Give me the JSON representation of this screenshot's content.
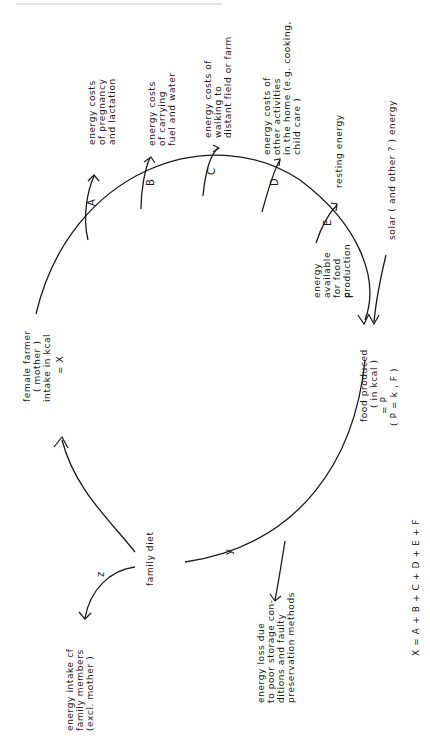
{
  "header_fragment": "",
  "nodes": {
    "mother": [
      "female farmer",
      "( mother )",
      "intake in kcal",
      "= X"
    ],
    "food_produced": [
      "food  produced",
      "( in  kcal )",
      "= P",
      "( P = k , F )"
    ],
    "family_diet": [
      "family diet"
    ]
  },
  "outflows": {
    "A": {
      "letter": "A",
      "lines": [
        "energy  costs",
        "of  pregnancy",
        "and  lactation"
      ]
    },
    "B": {
      "letter": "B",
      "lines": [
        "energy costs",
        "of  carrying",
        "fuel and  water"
      ]
    },
    "C": {
      "letter": "C",
      "lines": [
        "energy  costs  of",
        "walking  to",
        "distant  field  or  farm"
      ]
    },
    "D": {
      "letter": "D",
      "lines": [
        "energy  costs  of",
        "other  activities",
        "in  the  home (e.g. cooking,",
        "child  care )"
      ]
    },
    "E": {
      "letter": "E",
      "lines": [
        "resting  energy"
      ]
    },
    "F": {
      "letter": "F",
      "lines": [
        "energy",
        "available",
        "for  food",
        "production"
      ]
    }
  },
  "solar": {
    "lines": [
      "solar  ( and  other ? )  energy"
    ]
  },
  "loss": {
    "letter": "y",
    "lines": [
      "energy   loss  due",
      "to  poor  storage  con-",
      "ditions    and  faulty",
      "preservation  methods"
    ]
  },
  "family_members": {
    "letter": "z",
    "lines": [
      "energy   intake  cf",
      "family   members",
      "(excl.  mother )"
    ]
  },
  "equation": "X = A + B + C + D + E + F"
}
